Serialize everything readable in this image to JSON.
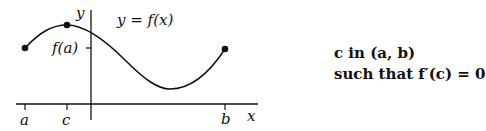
{
  "figure": {
    "function_label": "y = f(x)",
    "y_axis_label": "y",
    "x_axis_label": "x",
    "ytick_label": "f(a)",
    "xtick_labels": {
      "a": "a",
      "c": "c",
      "b": "b"
    },
    "points": [
      {
        "name": "a",
        "x": 25,
        "y": 48
      },
      {
        "name": "c",
        "x": 67,
        "y": 25
      },
      {
        "name": "b",
        "x": 255,
        "y": 49
      }
    ],
    "curve_color": "#111111"
  },
  "caption": {
    "line1": "c in (a, b)",
    "line2": "such that f′(c) = 0"
  }
}
